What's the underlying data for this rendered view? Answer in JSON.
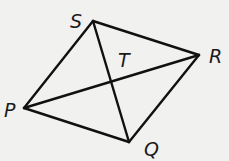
{
  "figure": {
    "type": "quadrilateral-with-diagonals",
    "background": "#f1f1f0",
    "line_color": "#111111",
    "vertices": {
      "S": {
        "x": 93,
        "y": 21,
        "label": "S",
        "label_x": 70,
        "label_y": 28
      },
      "R": {
        "x": 199,
        "y": 55,
        "label": "R",
        "label_x": 209,
        "label_y": 63
      },
      "Q": {
        "x": 129,
        "y": 142,
        "label": "Q",
        "label_x": 144,
        "label_y": 156
      },
      "P": {
        "x": 24,
        "y": 108,
        "label": "P",
        "label_x": 4,
        "label_y": 117
      }
    },
    "intersection": {
      "label": "T",
      "x": 112,
      "y": 81,
      "label_x": 118,
      "label_y": 67
    },
    "sides": [
      "PS",
      "SR",
      "RQ",
      "QP"
    ],
    "diagonals": [
      "PR",
      "SQ"
    ]
  }
}
